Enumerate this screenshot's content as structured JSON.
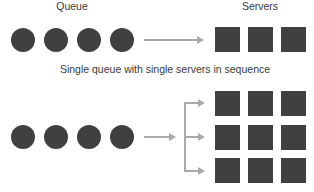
{
  "labels": {
    "queue": "Queue",
    "servers": "Servers",
    "caption": "Single queue with single servers in sequence"
  },
  "colors": {
    "shape": "#404040",
    "arrow": "#a9a9a9",
    "text": "#3a3a3a"
  },
  "top_diagram": {
    "queue_items": 4,
    "servers": 3,
    "arrangement": "sequence"
  },
  "bottom_diagram": {
    "queue_items": 4,
    "server_rows": 3,
    "servers_per_row": 3,
    "arrangement": "parallel branches"
  }
}
